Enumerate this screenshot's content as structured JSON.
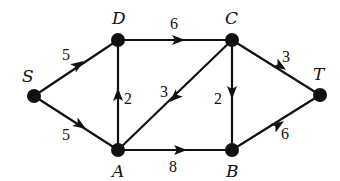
{
  "graph": {
    "directed": true,
    "nodes": [
      {
        "id": "S",
        "label": "S",
        "x": 34,
        "y": 96,
        "lx": 22,
        "ly": 82
      },
      {
        "id": "D",
        "label": "D",
        "x": 118,
        "y": 40,
        "lx": 112,
        "ly": 24
      },
      {
        "id": "C",
        "label": "C",
        "x": 232,
        "y": 40,
        "lx": 225,
        "ly": 24
      },
      {
        "id": "T",
        "label": "T",
        "x": 320,
        "y": 95,
        "lx": 313,
        "ly": 80
      },
      {
        "id": "A",
        "label": "A",
        "x": 118,
        "y": 150,
        "lx": 112,
        "ly": 177
      },
      {
        "id": "B",
        "label": "B",
        "x": 232,
        "y": 150,
        "lx": 226,
        "ly": 177
      }
    ],
    "edges": [
      {
        "from": "S",
        "to": "D",
        "weight": "5",
        "ax": 78,
        "ay": 65,
        "lx": 62,
        "ly": 60
      },
      {
        "from": "D",
        "to": "C",
        "weight": "6",
        "ax": 178,
        "ay": 40,
        "lx": 170,
        "ly": 29
      },
      {
        "from": "C",
        "to": "T",
        "weight": "3",
        "ax": 280,
        "ay": 66,
        "lx": 282,
        "ly": 62
      },
      {
        "from": "S",
        "to": "A",
        "weight": "5",
        "ax": 80,
        "ay": 125,
        "lx": 62,
        "ly": 140
      },
      {
        "from": "A",
        "to": "D",
        "weight": "2",
        "ax": 118,
        "ay": 95,
        "lx": 124,
        "ly": 104
      },
      {
        "from": "C",
        "to": "A",
        "weight": "3",
        "ax": 175,
        "ay": 97,
        "lx": 160,
        "ly": 97
      },
      {
        "from": "C",
        "to": "B",
        "weight": "2",
        "ax": 232,
        "ay": 92,
        "lx": 214,
        "ly": 104
      },
      {
        "from": "A",
        "to": "B",
        "weight": "8",
        "ax": 180,
        "ay": 150,
        "lx": 169,
        "ly": 172
      },
      {
        "from": "B",
        "to": "T",
        "weight": "6",
        "ax": 278,
        "ay": 125,
        "lx": 281,
        "ly": 139
      }
    ]
  }
}
